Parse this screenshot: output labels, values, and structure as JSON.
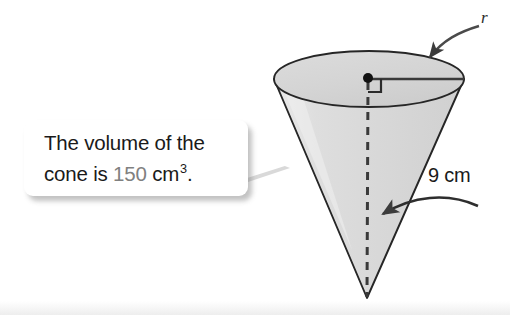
{
  "figure": {
    "type": "geometry-diagram",
    "shape": "cone",
    "orientation": "apex-down",
    "callout": {
      "line1": "The volume of the",
      "line2_prefix": "cone is ",
      "line2_value": "150",
      "line2_unit": " cm",
      "line2_exponent": "3",
      "line2_suffix": "."
    },
    "labels": {
      "radius": "r",
      "slant_height": "9 cm"
    },
    "colors": {
      "body_fill": "#dcdcdc",
      "top_fill": "#d2d2d2",
      "outline": "#262626",
      "arrow": "#4a4a4a",
      "accent_text": "#808080",
      "text": "#1a1a1a",
      "background": "#ffffff"
    },
    "annotations": {
      "center_point": "center-dot",
      "right_angle": "right-angle-marker",
      "height_line": "dashed-vertical-axis"
    }
  }
}
